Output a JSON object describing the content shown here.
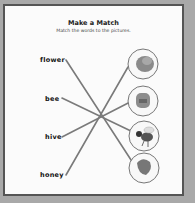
{
  "worksheet": {
    "title": "Make a Match",
    "instructions": "Match the words to the pictures.",
    "words": [
      "flower",
      "bee",
      "hive",
      "honey"
    ],
    "pictures": [
      "flower-picture",
      "hive-picture",
      "bee-picture",
      "honey-picture"
    ],
    "matches": [
      {
        "word": "flower",
        "picture_index": 3
      },
      {
        "word": "bee",
        "picture_index": 2
      },
      {
        "word": "hive",
        "picture_index": 1
      },
      {
        "word": "honey",
        "picture_index": 0
      }
    ],
    "colors": {
      "background": "#a9a9a9",
      "card": "#fbfbfb",
      "border": "#555555",
      "line": "#7a7a7a"
    }
  }
}
